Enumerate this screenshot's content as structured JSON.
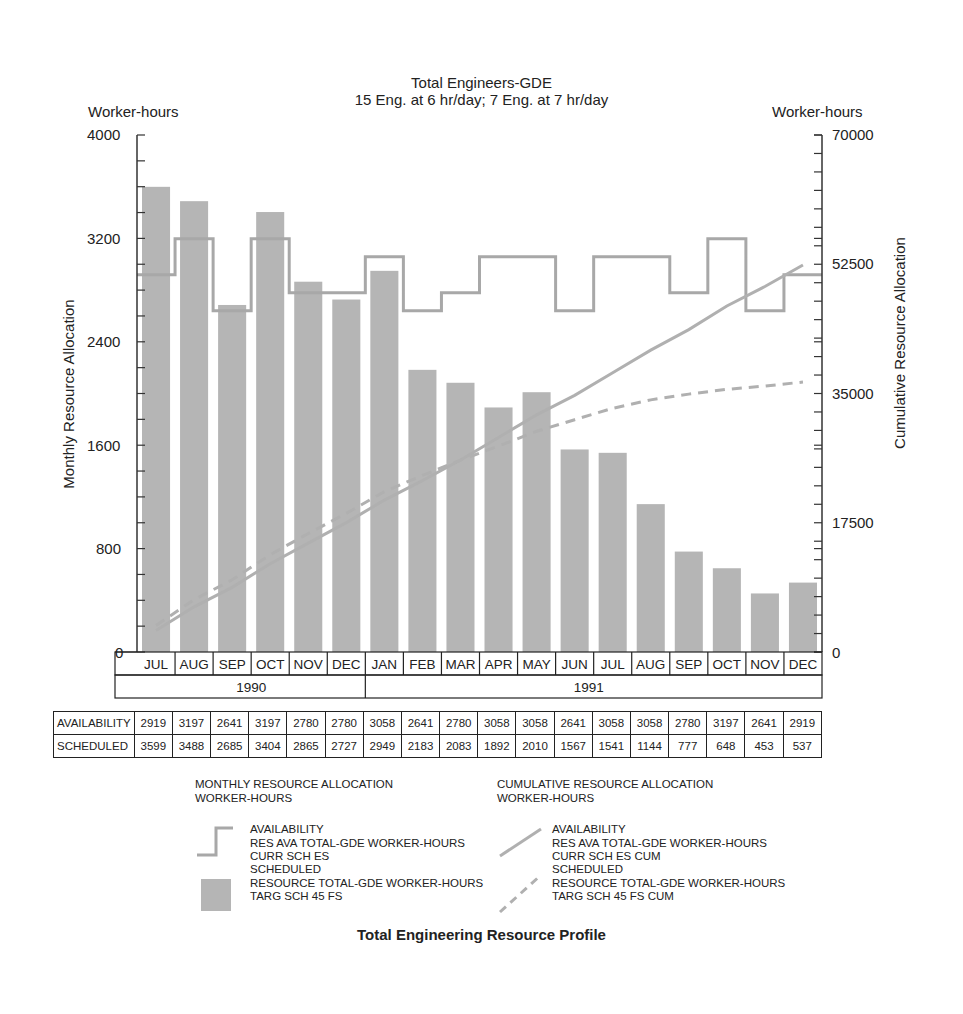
{
  "header": {
    "title_line1": "Total Engineers-GDE",
    "title_line2": "15 Eng. at 6 hr/day; 7 Eng. at 7 hr/day"
  },
  "axes": {
    "left_unit": "Worker-hours",
    "right_unit": "Worker-hours",
    "left_title": "Monthly Resource Allocation",
    "right_title": "Cumulative Resource Allocation",
    "left_ticks": [
      "4000",
      "3200",
      "2400",
      "1600",
      "800",
      "0"
    ],
    "right_ticks": [
      "70000",
      "52500",
      "35000",
      "17500",
      "0"
    ]
  },
  "months": [
    "JUL",
    "AUG",
    "SEP",
    "OCT",
    "NOV",
    "DEC",
    "JAN",
    "FEB",
    "MAR",
    "APR",
    "MAY",
    "JUN",
    "JUL",
    "AUG",
    "SEP",
    "OCT",
    "NOV",
    "DEC"
  ],
  "years": [
    {
      "label": "1990",
      "span": 6
    },
    {
      "label": "1991",
      "span": 12
    }
  ],
  "table": {
    "rows": [
      {
        "label": "AVAILABILITY",
        "values": [
          "2919",
          "3197",
          "2641",
          "3197",
          "2780",
          "2780",
          "3058",
          "2641",
          "2780",
          "3058",
          "3058",
          "2641",
          "3058",
          "3058",
          "2780",
          "3197",
          "2641",
          "2919"
        ]
      },
      {
        "label": "SCHEDULED",
        "values": [
          "3599",
          "3488",
          "2685",
          "3404",
          "2865",
          "2727",
          "2949",
          "2183",
          "2083",
          "1892",
          "2010",
          "1567",
          "1541",
          "1144",
          "777",
          "648",
          "453",
          "537"
        ]
      }
    ]
  },
  "legend": {
    "monthly": {
      "heading_line1": "MONTHLY RESOURCE ALLOCATION",
      "heading_line2": "WORKER-HOURS",
      "availability": [
        "AVAILABILITY",
        "RES AVA TOTAL-GDE WORKER-HOURS",
        "CURR SCH ES"
      ],
      "scheduled": [
        "SCHEDULED",
        "RESOURCE TOTAL-GDE WORKER-HOURS",
        "TARG SCH 45 FS"
      ]
    },
    "cumulative": {
      "heading_line1": "CUMULATIVE RESOURCE ALLOCATION",
      "heading_line2": "WORKER-HOURS",
      "availability": [
        "AVAILABILITY",
        "RES AVA TOTAL-GDE WORKER-HOURS",
        "CURR SCH ES CUM"
      ],
      "scheduled": [
        "SCHEDULED",
        "RESOURCE TOTAL-GDE WORKER-HOURS",
        "TARG SCH 45 FS CUM"
      ]
    }
  },
  "footer": {
    "caption": "Total Engineering Resource Profile"
  },
  "colors": {
    "bar": "#b5b5b5",
    "availability_line": "#a8a8a8",
    "cumulative_line": "#b0b0b0",
    "axis": "#333333"
  },
  "chart_data": {
    "type": "bar",
    "title": "Total Engineers-GDE",
    "subtitle": "15 Eng. at 6 hr/day; 7 Eng. at 7 hr/day",
    "caption": "Total Engineering Resource Profile",
    "categories": [
      "JUL 1990",
      "AUG 1990",
      "SEP 1990",
      "OCT 1990",
      "NOV 1990",
      "DEC 1990",
      "JAN 1991",
      "FEB 1991",
      "MAR 1991",
      "APR 1991",
      "MAY 1991",
      "JUN 1991",
      "JUL 1991",
      "AUG 1991",
      "SEP 1991",
      "OCT 1991",
      "NOV 1991",
      "DEC 1991"
    ],
    "series": [
      {
        "name": "Scheduled (monthly, bars)",
        "axis": "left",
        "type": "bar",
        "values": [
          3599,
          3488,
          2685,
          3404,
          2865,
          2727,
          2949,
          2183,
          2083,
          1892,
          2010,
          1567,
          1541,
          1144,
          777,
          648,
          453,
          537
        ]
      },
      {
        "name": "Availability (monthly, step line)",
        "axis": "left",
        "type": "step",
        "values": [
          2919,
          3197,
          2641,
          3197,
          2780,
          2780,
          3058,
          2641,
          2780,
          3058,
          3058,
          2641,
          3058,
          3058,
          2780,
          3197,
          2641,
          2919
        ]
      },
      {
        "name": "Availability cumulative (solid line)",
        "axis": "right",
        "type": "line",
        "values": [
          2919,
          6116,
          8757,
          11954,
          14734,
          17514,
          20572,
          23213,
          25993,
          29051,
          32109,
          34750,
          37808,
          40866,
          43646,
          46843,
          49484,
          52403
        ]
      },
      {
        "name": "Scheduled cumulative (dashed line)",
        "axis": "right",
        "type": "line",
        "values": [
          3599,
          7087,
          9772,
          13176,
          16041,
          18768,
          21717,
          23900,
          25983,
          27875,
          29885,
          31452,
          32993,
          34137,
          34914,
          35562,
          36015,
          36552
        ]
      }
    ],
    "xlabel": "",
    "ylabel": "Monthly Resource Allocation (Worker-hours)",
    "y2label": "Cumulative Resource Allocation (Worker-hours)",
    "ylim": [
      0,
      4000
    ],
    "y2lim": [
      0,
      70000
    ],
    "yticks": [
      0,
      800,
      1600,
      2400,
      3200,
      4000
    ],
    "y2ticks": [
      0,
      17500,
      35000,
      52500,
      70000
    ],
    "grid": false,
    "legend_position": "bottom"
  }
}
